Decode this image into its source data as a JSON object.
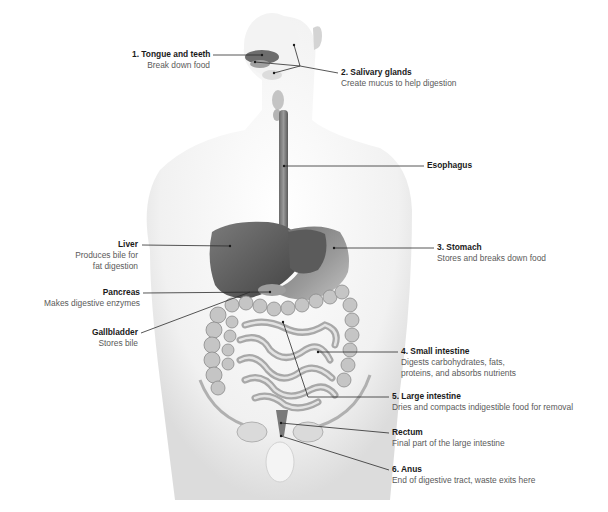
{
  "diagram": {
    "type": "anatomical-illustration",
    "colors": {
      "organ_dark": "#5f5f5f",
      "organ_mid": "#8a8a8a",
      "organ_light": "#c8c8c8",
      "body_skin": "#f2f2f2",
      "leader_line": "#2b2b2b",
      "title_text": "#1a1a1a",
      "desc_text": "#5a5a5a"
    },
    "labels": [
      {
        "id": "tongue",
        "title": "1. Tongue and teeth",
        "desc": [
          "Break down food"
        ]
      },
      {
        "id": "salivary",
        "title": "2. Salivary glands",
        "desc": [
          "Create mucus to help digestion"
        ]
      },
      {
        "id": "esophagus",
        "title": "Esophagus",
        "desc": []
      },
      {
        "id": "liver",
        "title": "Liver",
        "desc": [
          "Produces bile for",
          "fat digestion"
        ]
      },
      {
        "id": "stomach",
        "title": "3. Stomach",
        "desc": [
          "Stores and breaks down food"
        ]
      },
      {
        "id": "pancreas",
        "title": "Pancreas",
        "desc": [
          "Makes digestive enzymes"
        ]
      },
      {
        "id": "gallbladder",
        "title": "Gallbladder",
        "desc": [
          "Stores bile"
        ]
      },
      {
        "id": "small_intestine",
        "title": "4. Small intestine",
        "desc": [
          "Digests carbohydrates, fats,",
          "proteins, and absorbs nutrients"
        ]
      },
      {
        "id": "large_intestine",
        "title": "5. Large intestine",
        "desc": [
          "Dries and compacts indigestible food for removal"
        ]
      },
      {
        "id": "rectum",
        "title": "Rectum",
        "desc": [
          "Final part of the large intestine"
        ]
      },
      {
        "id": "anus",
        "title": "6. Anus",
        "desc": [
          "End of digestive tract, waste exits here"
        ]
      }
    ]
  }
}
